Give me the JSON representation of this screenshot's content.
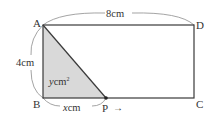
{
  "diagram": {
    "type": "rectangle-moving-point",
    "vertices": {
      "A": "A",
      "B": "B",
      "C": "C",
      "D": "D",
      "P": "P"
    },
    "dimensions": {
      "top_length": "8cm",
      "left_length": "4cm",
      "bp_length_var": "x",
      "bp_length_unit": "cm",
      "area_var": "y",
      "area_unit": "cm",
      "area_exp": "2"
    },
    "arrow": "→",
    "colors": {
      "line": "#3a3a3a",
      "fill": "#d9d9d9",
      "brace": "#9a9a9a",
      "text": "#333333"
    }
  }
}
